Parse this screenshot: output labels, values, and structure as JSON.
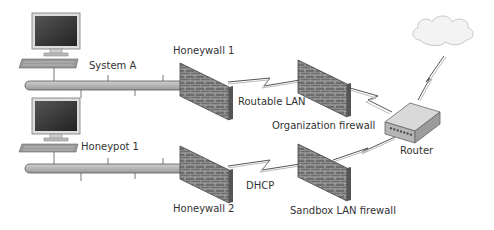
{
  "labels": {
    "system_a": "System A",
    "honeypot_1": "Honeypot 1",
    "honeywall_1": "Honeywall 1",
    "honeywall_2": "Honeywall 2",
    "routable_lan": "Routable LAN",
    "dhcp": "DHCP",
    "organization_firewall": "Organization firewall",
    "sandbox_lan_firewall": "Sandbox LAN firewall",
    "router": "Router"
  },
  "nodes": [
    {
      "id": "system-a",
      "type": "computer"
    },
    {
      "id": "honeypot-1",
      "type": "computer"
    },
    {
      "id": "honeywall-1",
      "type": "firewall"
    },
    {
      "id": "honeywall-2",
      "type": "firewall"
    },
    {
      "id": "organization-firewall",
      "type": "firewall"
    },
    {
      "id": "sandbox-lan-firewall",
      "type": "firewall"
    },
    {
      "id": "router",
      "type": "router"
    },
    {
      "id": "internet",
      "type": "cloud"
    }
  ],
  "edges": [
    {
      "from": "system-a",
      "to": "honeywall-1",
      "type": "bus"
    },
    {
      "from": "honeywall-1",
      "to": "organization-firewall",
      "type": "lightning",
      "label": "Routable LAN"
    },
    {
      "from": "organization-firewall",
      "to": "router",
      "type": "lightning"
    },
    {
      "from": "honeypot-1",
      "to": "honeywall-2",
      "type": "bus"
    },
    {
      "from": "honeywall-2",
      "to": "sandbox-lan-firewall",
      "type": "lightning",
      "label": "DHCP"
    },
    {
      "from": "sandbox-lan-firewall",
      "to": "router",
      "type": "line"
    },
    {
      "from": "router",
      "to": "internet",
      "type": "lightning"
    }
  ]
}
